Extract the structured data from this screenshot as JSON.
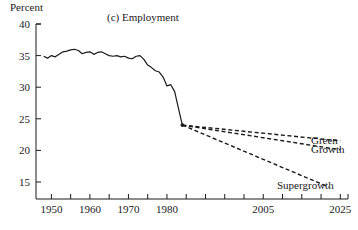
{
  "chart_data": {
    "type": "line",
    "title": "(c) Employment",
    "xlabel": "",
    "ylabel": "Percent",
    "ylim": [
      13,
      40
    ],
    "xlim": [
      1946,
      2027
    ],
    "grid": false,
    "legend_position": "right-inline-labels",
    "yticks": [
      40,
      35,
      30,
      25,
      20,
      15
    ],
    "xticks": [
      1950,
      1955,
      1960,
      1965,
      1970,
      1975,
      1980,
      1985,
      1990,
      1995,
      2000,
      2005,
      2010,
      2015,
      2020,
      2025
    ],
    "xtick_labels": [
      "1950",
      "",
      "1960",
      "",
      "1970",
      "",
      "1980",
      "",
      "",
      "",
      "",
      "2005",
      "",
      "",
      "",
      "2025"
    ],
    "branch_point": {
      "x": 1984,
      "y": 24.0
    },
    "series": [
      {
        "name": "Historical",
        "style": "solid",
        "x": [
          1948,
          1949,
          1950,
          1951,
          1952,
          1953,
          1954,
          1955,
          1956,
          1957,
          1958,
          1959,
          1960,
          1961,
          1962,
          1963,
          1964,
          1965,
          1966,
          1967,
          1968,
          1969,
          1970,
          1971,
          1972,
          1973,
          1974,
          1975,
          1976,
          1977,
          1978,
          1979,
          1980,
          1981,
          1982,
          1983,
          1984
        ],
        "values": [
          34.9,
          34.6,
          35.0,
          34.8,
          35.2,
          35.6,
          35.7,
          35.9,
          36.0,
          35.8,
          35.3,
          35.5,
          35.6,
          35.2,
          35.5,
          35.6,
          35.3,
          35.0,
          34.9,
          35.0,
          34.8,
          34.9,
          34.6,
          34.5,
          34.9,
          35.0,
          34.4,
          33.5,
          33.1,
          32.6,
          32.4,
          31.6,
          30.2,
          30.4,
          29.3,
          26.6,
          24.0
        ]
      },
      {
        "name": "Green",
        "style": "dashed",
        "x": [
          1984,
          2025
        ],
        "values": [
          24.0,
          21.5
        ]
      },
      {
        "name": "Growth",
        "style": "dashed",
        "x": [
          1984,
          2025
        ],
        "values": [
          24.0,
          20.1
        ]
      },
      {
        "name": "Supergrowth",
        "style": "dashed",
        "x": [
          1984,
          2022
        ],
        "values": [
          24.0,
          14.2
        ]
      }
    ],
    "annotations": [
      {
        "text": "Green",
        "x": 2026,
        "y": 21.5
      },
      {
        "text": "Growth",
        "x": 2026,
        "y": 20.1
      },
      {
        "text": "Supergrowth",
        "x": 2019,
        "y": 13.0
      }
    ]
  },
  "axis": {
    "unit_label": "Percent"
  },
  "colors": {
    "line": "#1a1a1a",
    "background": "#ffffff",
    "axis": "#1a1a1a"
  }
}
